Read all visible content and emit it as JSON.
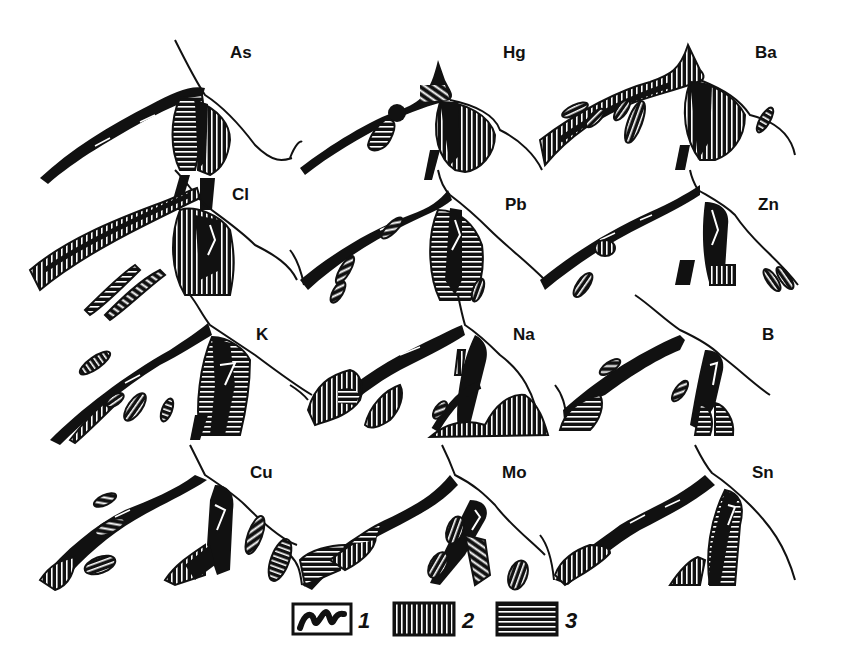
{
  "figure": {
    "panels": [
      {
        "element": "As",
        "row": 0,
        "col": 0
      },
      {
        "element": "Hg",
        "row": 0,
        "col": 1
      },
      {
        "element": "Ba",
        "row": 0,
        "col": 2
      },
      {
        "element": "Cl",
        "row": 1,
        "col": 0
      },
      {
        "element": "Pb",
        "row": 1,
        "col": 1
      },
      {
        "element": "Zn",
        "row": 1,
        "col": 2
      },
      {
        "element": "K",
        "row": 2,
        "col": 0
      },
      {
        "element": "Na",
        "row": 2,
        "col": 1
      },
      {
        "element": "B",
        "row": 2,
        "col": 2
      },
      {
        "element": "Cu",
        "row": 3,
        "col": 0
      },
      {
        "element": "Mo",
        "row": 3,
        "col": 1
      },
      {
        "element": "Sn",
        "row": 3,
        "col": 2
      }
    ],
    "legend": [
      {
        "number": "1",
        "pattern": "solid-black-vein"
      },
      {
        "number": "2",
        "pattern": "vertical-hatch"
      },
      {
        "number": "3",
        "pattern": "horizontal-hatch"
      }
    ],
    "colors": {
      "ink": "#111111",
      "paper": "#ffffff"
    }
  }
}
